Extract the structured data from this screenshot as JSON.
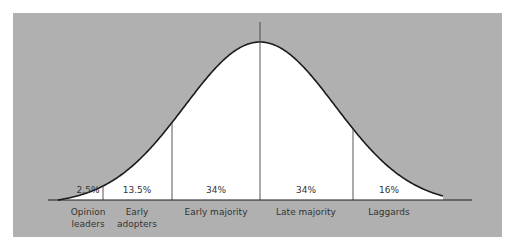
{
  "title": "",
  "colors": {
    "panel": "#b0b0b0",
    "curve_fill": "#ffffff",
    "curve_stroke": "#1a1a1a",
    "divider": "#444444",
    "text": "#333333"
  },
  "segments": [
    {
      "id": "opinion-leaders",
      "label_lines": [
        "Opinion",
        "leaders"
      ],
      "percent": "2.5%",
      "value": 2.5
    },
    {
      "id": "early-adopters",
      "label_lines": [
        "Early",
        "adopters"
      ],
      "percent": "13.5%",
      "value": 13.5
    },
    {
      "id": "early-majority",
      "label_lines": [
        "Early majority"
      ],
      "percent": "34%",
      "value": 34
    },
    {
      "id": "late-majority",
      "label_lines": [
        "Late majority"
      ],
      "percent": "34%",
      "value": 34
    },
    {
      "id": "laggards",
      "label_lines": [
        "Laggards"
      ],
      "percent": "16%",
      "value": 16
    }
  ]
}
